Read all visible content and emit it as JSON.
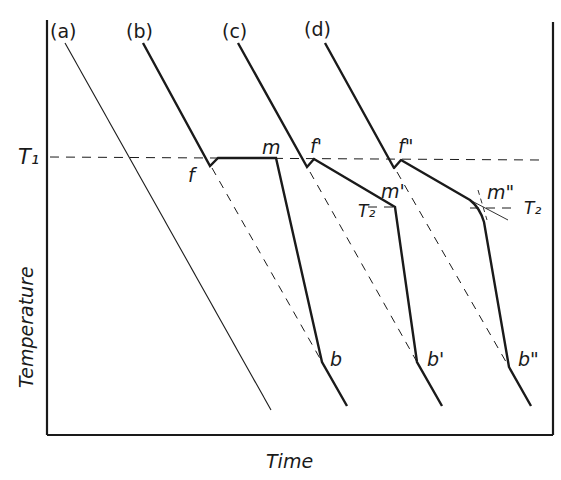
{
  "figure": {
    "x_axis_label": "Time",
    "y_axis_label": "Temperature",
    "reference_lines": {
      "T1": "T₁",
      "T2_left": "T₂",
      "T2_right": "T₂"
    },
    "curves": [
      {
        "id": "a",
        "label": "(a)",
        "points": []
      },
      {
        "id": "b",
        "label": "(b)",
        "points": [
          "f",
          "m",
          "b"
        ]
      },
      {
        "id": "c",
        "label": "(c)",
        "points": [
          "f'",
          "m'",
          "b'"
        ]
      },
      {
        "id": "d",
        "label": "(d)",
        "points": [
          "f\"",
          "m\"",
          "b\""
        ]
      }
    ],
    "point_labels": {
      "f": "f",
      "m": "m",
      "b": "b",
      "f1": "f'",
      "m1": "m'",
      "b1": "b'",
      "f2": "f\"",
      "m2": "m\"",
      "b2": "b\""
    }
  },
  "colors": {
    "ink": "#1a1a1a",
    "background": "#ffffff"
  }
}
